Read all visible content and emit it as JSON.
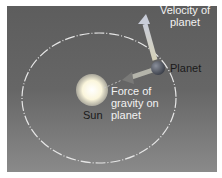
{
  "diagram": {
    "labels": {
      "velocity": [
        "Velocity of",
        "planet"
      ],
      "planet": "Planet",
      "force": [
        "Force of",
        "gravity on",
        "planet"
      ],
      "sun": "Sun"
    },
    "colors": {
      "background_top": "#5d5d5d",
      "background_bottom": "#8a8a8a",
      "orbit": "#e8e8e8",
      "sun": "#fffbe8",
      "planet": "#555a66",
      "arrows": "#d8d8c8"
    }
  }
}
